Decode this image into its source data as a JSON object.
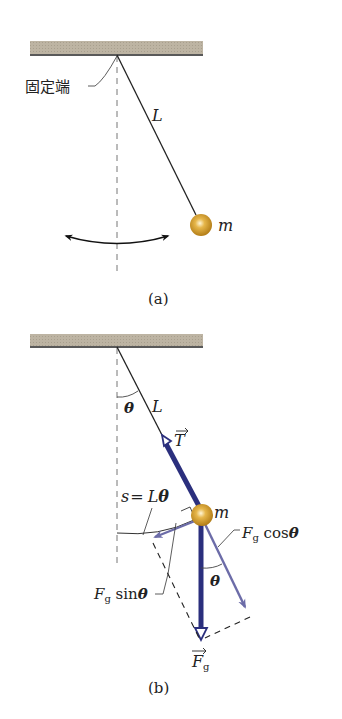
{
  "figure_a": {
    "caption": "(a)",
    "pivot_label": "固定端",
    "string_label": "L",
    "mass_label": "m"
  },
  "figure_b": {
    "caption": "(b)",
    "angle_label_top": "θ",
    "string_label": "L",
    "tension_label": "T",
    "arc_label_s": "s",
    "arc_label_eq": "=",
    "arc_label_L": "L",
    "arc_label_theta": "θ",
    "mass_label": "m",
    "fg_cos_F": "F",
    "fg_cos_sub": "g",
    "fg_cos_fn": " cos",
    "fg_cos_theta": "θ",
    "fg_sin_F": "F",
    "fg_sin_sub": "g",
    "fg_sin_fn": " sin",
    "fg_sin_theta": "θ",
    "angle_label_bottom": "θ",
    "gravity_F": "F",
    "gravity_sub": "g"
  },
  "colors": {
    "ceiling": "#bcb3a2",
    "force_dark": "#2b2f7d",
    "force_light": "#6c6ca8",
    "bob": "#d5a233"
  }
}
